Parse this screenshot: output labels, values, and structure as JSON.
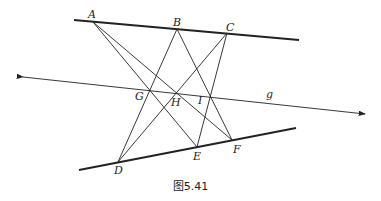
{
  "figure": {
    "caption": "图5.41",
    "colors": {
      "ink": "#222222",
      "background": "#ffffff"
    },
    "points": [
      {
        "id": "A",
        "label": "A"
      },
      {
        "id": "B",
        "label": "B"
      },
      {
        "id": "C",
        "label": "C"
      },
      {
        "id": "D",
        "label": "D"
      },
      {
        "id": "E",
        "label": "E"
      },
      {
        "id": "F",
        "label": "F"
      },
      {
        "id": "G",
        "label": "G"
      },
      {
        "id": "H",
        "label": "H"
      },
      {
        "id": "I",
        "label": "I"
      }
    ],
    "lines": {
      "top_line": {
        "through": [
          "A",
          "B",
          "C"
        ],
        "style": "thick"
      },
      "bottom_line": {
        "through": [
          "D",
          "E",
          "F"
        ],
        "style": "thick"
      },
      "axis_line": {
        "label": "g",
        "through": [
          "G",
          "H",
          "I"
        ],
        "style": "double-arrow"
      }
    },
    "segments": [
      {
        "from": "A",
        "to": "E"
      },
      {
        "from": "A",
        "to": "F"
      },
      {
        "from": "B",
        "to": "D"
      },
      {
        "from": "B",
        "to": "F"
      },
      {
        "from": "C",
        "to": "D"
      },
      {
        "from": "C",
        "to": "E"
      }
    ],
    "axis_label": "g"
  }
}
